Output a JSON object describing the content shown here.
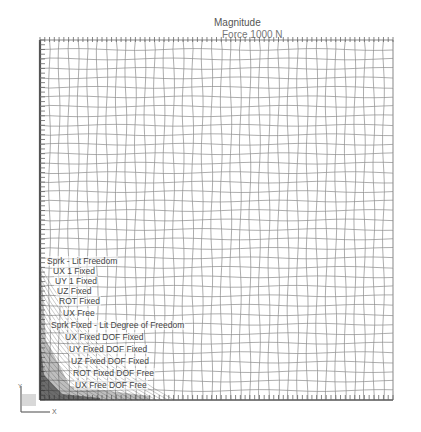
{
  "header": {
    "title": "Magnitude",
    "subtitle": "Force 1000 N"
  },
  "mesh": {
    "left": 40,
    "top": 40,
    "right": 393,
    "bottom": 400,
    "cells_x": 37,
    "cells_y": 38,
    "line_color": "#8a8a8a",
    "edge_color": "#555555",
    "dense_corner_color": "#3a3a3a"
  },
  "labels": [
    {
      "text": "Sprk - Lit Freedom",
      "x": 46,
      "y": 256
    },
    {
      "text": "UX 1 Fixed",
      "x": 52,
      "y": 266
    },
    {
      "text": "UY 1 Fixed",
      "x": 54,
      "y": 276
    },
    {
      "text": "UZ Fixed",
      "x": 56,
      "y": 286
    },
    {
      "text": "ROT Fixed",
      "x": 58,
      "y": 296
    },
    {
      "text": "UX Free",
      "x": 62,
      "y": 308
    },
    {
      "text": "Sprk Fixed - Lit Degree of Freedom",
      "x": 50,
      "y": 320
    },
    {
      "text": "UX Fixed   DOF Fixed",
      "x": 64,
      "y": 332
    },
    {
      "text": "UY Fixed   DOF Fixed",
      "x": 68,
      "y": 344
    },
    {
      "text": "UZ Fixed   DOF Fixed",
      "x": 70,
      "y": 356
    },
    {
      "text": "ROT Fixed  DOF Free",
      "x": 72,
      "y": 368
    },
    {
      "text": "UX Free    DOF Free",
      "x": 74,
      "y": 380
    }
  ],
  "triad": {
    "y_label": "Y",
    "x_label": "X"
  }
}
